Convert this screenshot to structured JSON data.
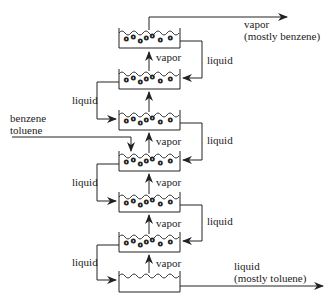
{
  "diagram": {
    "labels": {
      "top_vapor": "vapor",
      "top_vapor_note": "(mostly benzene)",
      "bottom_liquid": "liquid",
      "bottom_liquid_note": "(mostly toluene)",
      "feed_line1": "benzene",
      "feed_line2": "toluene",
      "vapor": "vapor",
      "liquid": "liquid"
    },
    "trays": [
      {
        "y": 28
      },
      {
        "y": 69
      },
      {
        "y": 110
      },
      {
        "y": 151
      },
      {
        "y": 192
      },
      {
        "y": 232
      },
      {
        "y": 271
      }
    ],
    "colors": {
      "line": "#222222",
      "text": "#222222"
    }
  }
}
